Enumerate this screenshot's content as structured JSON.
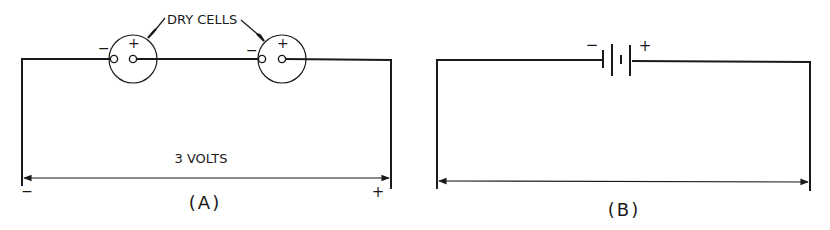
{
  "figure_a": {
    "caption": "(A)",
    "callout_label": "DRY CELLS",
    "voltage_label": "3 VOLTS",
    "left_polarity": "−",
    "right_polarity": "+",
    "cells": [
      {
        "neg_label": "−",
        "pos_label": "+"
      },
      {
        "neg_label": "−",
        "pos_label": "+"
      }
    ]
  },
  "figure_b": {
    "caption": "(B)",
    "battery_neg_label": "−",
    "battery_pos_label": "+"
  },
  "colors": {
    "ink": "#1a1a1a",
    "background": "#ffffff"
  }
}
